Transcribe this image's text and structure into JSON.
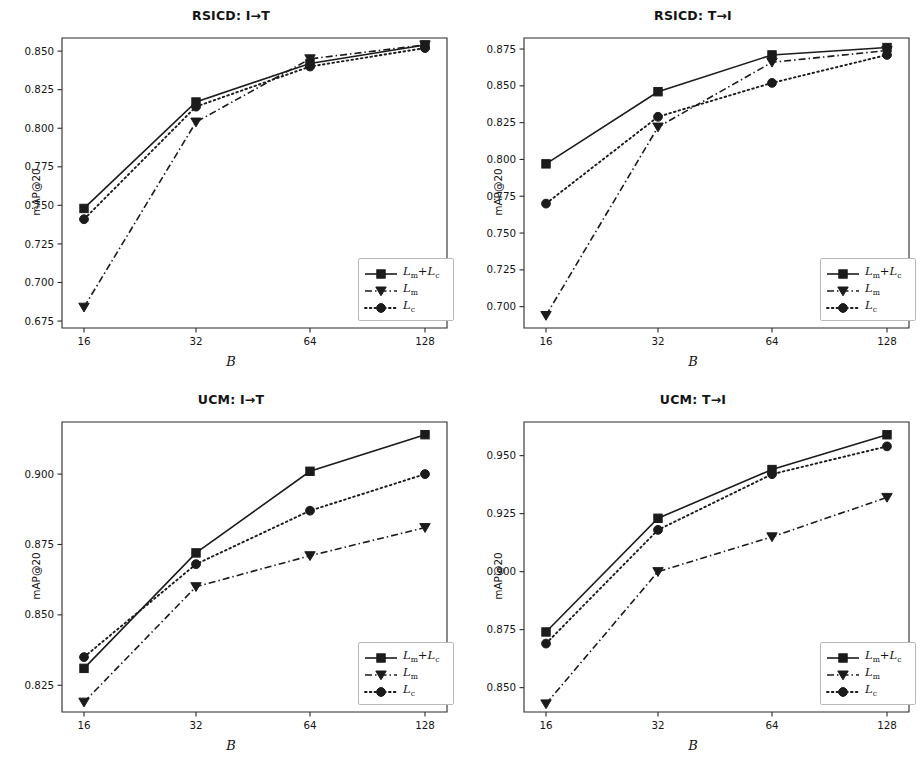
{
  "figure": {
    "panel_order": [
      "rsicd_i2t",
      "rsicd_t2i",
      "ucm_i2t",
      "ucm_t2i"
    ],
    "xlabel": "B",
    "ylabel": "mAP@20",
    "legend_labels": [
      "Lm+Lc",
      "Lm",
      "Lc"
    ]
  },
  "chart_data": [
    {
      "id": "rsicd_i2t",
      "type": "line",
      "title": "RSICD: I→T",
      "xlabel": "B",
      "ylabel": "mAP@20",
      "categories": [
        "16",
        "32",
        "64",
        "128"
      ],
      "x": [
        16,
        32,
        64,
        128
      ],
      "xscale": "categorical",
      "ylim": [
        0.6705,
        0.8585
      ],
      "yticks": [
        0.675,
        0.7,
        0.725,
        0.75,
        0.775,
        0.8,
        0.825,
        0.85
      ],
      "ytick_labels": [
        "0.675",
        "0.700",
        "0.725",
        "0.750",
        "0.775",
        "0.800",
        "0.825",
        "0.850"
      ],
      "grid": false,
      "legend_position": "lower right",
      "series": [
        {
          "name": "Lm+Lc",
          "style": "solid",
          "marker": "square",
          "values": [
            0.748,
            0.817,
            0.842,
            0.854
          ]
        },
        {
          "name": "Lm",
          "style": "dashdot",
          "marker": "triangle",
          "values": [
            0.684,
            0.804,
            0.845,
            0.854
          ]
        },
        {
          "name": "Lc",
          "style": "dotted",
          "marker": "circle",
          "values": [
            0.741,
            0.814,
            0.84,
            0.852
          ]
        }
      ]
    },
    {
      "id": "rsicd_t2i",
      "type": "line",
      "title": "RSICD: T→I",
      "xlabel": "B",
      "ylabel": "mAP@20",
      "categories": [
        "16",
        "32",
        "64",
        "128"
      ],
      "x": [
        16,
        32,
        64,
        128
      ],
      "xscale": "categorical",
      "ylim": [
        0.6855,
        0.8825
      ],
      "yticks": [
        0.7,
        0.725,
        0.75,
        0.775,
        0.8,
        0.825,
        0.85,
        0.875
      ],
      "ytick_labels": [
        "0.700",
        "0.725",
        "0.750",
        "0.775",
        "0.800",
        "0.825",
        "0.850",
        "0.875"
      ],
      "grid": false,
      "legend_position": "lower right",
      "series": [
        {
          "name": "Lm+Lc",
          "style": "solid",
          "marker": "square",
          "values": [
            0.797,
            0.846,
            0.871,
            0.876
          ]
        },
        {
          "name": "Lm",
          "style": "dashdot",
          "marker": "triangle",
          "values": [
            0.694,
            0.822,
            0.866,
            0.874
          ]
        },
        {
          "name": "Lc",
          "style": "dotted",
          "marker": "circle",
          "values": [
            0.77,
            0.829,
            0.852,
            0.871
          ]
        }
      ]
    },
    {
      "id": "ucm_i2t",
      "type": "line",
      "title": "UCM: I→T",
      "xlabel": "B",
      "ylabel": "mAP@20",
      "categories": [
        "16",
        "32",
        "64",
        "128"
      ],
      "x": [
        16,
        32,
        64,
        128
      ],
      "xscale": "categorical",
      "ylim": [
        0.8155,
        0.9185
      ],
      "yticks": [
        0.825,
        0.85,
        0.875,
        0.9
      ],
      "ytick_labels": [
        "0.825",
        "0.850",
        "0.875",
        "0.900"
      ],
      "grid": false,
      "legend_position": "lower right",
      "series": [
        {
          "name": "Lm+Lc",
          "style": "solid",
          "marker": "square",
          "values": [
            0.831,
            0.872,
            0.901,
            0.914
          ]
        },
        {
          "name": "Lm",
          "style": "dashdot",
          "marker": "triangle",
          "values": [
            0.819,
            0.86,
            0.871,
            0.881
          ]
        },
        {
          "name": "Lc",
          "style": "dotted",
          "marker": "circle",
          "values": [
            0.835,
            0.868,
            0.887,
            0.9
          ]
        }
      ]
    },
    {
      "id": "ucm_t2i",
      "type": "line",
      "title": "UCM: T→I",
      "xlabel": "B",
      "ylabel": "mAP@20",
      "categories": [
        "16",
        "32",
        "64",
        "128"
      ],
      "x": [
        16,
        32,
        64,
        128
      ],
      "xscale": "categorical",
      "ylim": [
        0.8395,
        0.9645
      ],
      "yticks": [
        0.85,
        0.875,
        0.9,
        0.925,
        0.95
      ],
      "ytick_labels": [
        "0.850",
        "0.875",
        "0.900",
        "0.925",
        "0.950"
      ],
      "grid": false,
      "legend_position": "lower right",
      "series": [
        {
          "name": "Lm+Lc",
          "style": "solid",
          "marker": "square",
          "values": [
            0.874,
            0.923,
            0.944,
            0.959
          ]
        },
        {
          "name": "Lm",
          "style": "dashdot",
          "marker": "triangle",
          "values": [
            0.843,
            0.9,
            0.915,
            0.932
          ]
        },
        {
          "name": "Lc",
          "style": "dotted",
          "marker": "circle",
          "values": [
            0.869,
            0.918,
            0.942,
            0.954
          ]
        }
      ]
    }
  ]
}
